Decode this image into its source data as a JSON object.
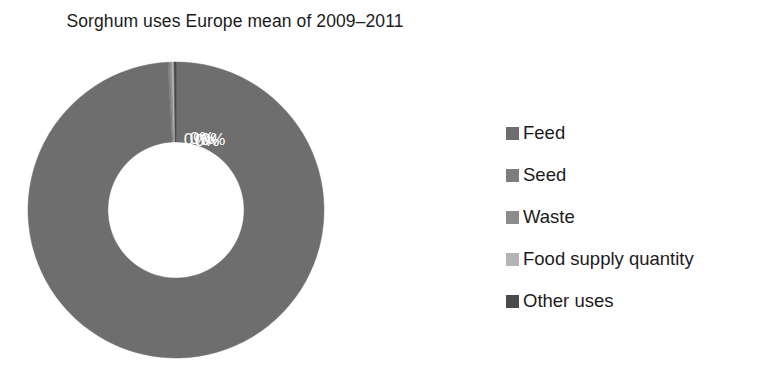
{
  "chart_data": {
    "type": "pie",
    "variant": "donut",
    "title": "Sorghum uses Europe mean of 2009–2011",
    "xlabel": "",
    "ylabel": "",
    "categories": [
      "Feed",
      "Seed",
      "Waste",
      "Food supply quantity",
      "Other uses"
    ],
    "values": [
      99,
      0,
      0,
      0,
      0
    ],
    "value_labels": [
      "99%",
      "0%",
      "0%",
      "0%",
      "0%"
    ],
    "colors": [
      "#6e6e6e",
      "#7d7d7d",
      "#8c8c8c",
      "#b4b4b4",
      "#4a4a4a"
    ],
    "legend_position": "right",
    "grid": false,
    "hole_ratio": 0.46,
    "data_label_color": "#ffffff",
    "series": [
      {
        "name": "Sorghum uses Europe mean of 2009–2011",
        "values": [
          99,
          0,
          0,
          0,
          0
        ]
      }
    ]
  },
  "title": {
    "text": "Sorghum uses Europe mean of 2009–2011"
  },
  "donut": {
    "slices": [
      {
        "label": "Feed",
        "value": 99,
        "value_label": "99%",
        "color": "#6e6e6e"
      },
      {
        "label": "Seed",
        "value": 0,
        "value_label": "0%",
        "color": "#7d7d7d"
      },
      {
        "label": "Waste",
        "value": 0,
        "value_label": "0%",
        "color": "#8c8c8c"
      },
      {
        "label": "Food supply quantity",
        "value": 0,
        "value_label": "0%",
        "color": "#b4b4b4"
      },
      {
        "label": "Other uses",
        "value": 0,
        "value_label": "0%",
        "color": "#4a4a4a"
      }
    ]
  },
  "legend": {
    "items": [
      {
        "label": "Feed",
        "color": "#6e6e6e"
      },
      {
        "label": "Seed",
        "color": "#7d7d7d"
      },
      {
        "label": "Waste",
        "color": "#8c8c8c"
      },
      {
        "label": "Food supply quantity",
        "color": "#b4b4b4"
      },
      {
        "label": "Other uses",
        "color": "#4a4a4a"
      }
    ]
  }
}
